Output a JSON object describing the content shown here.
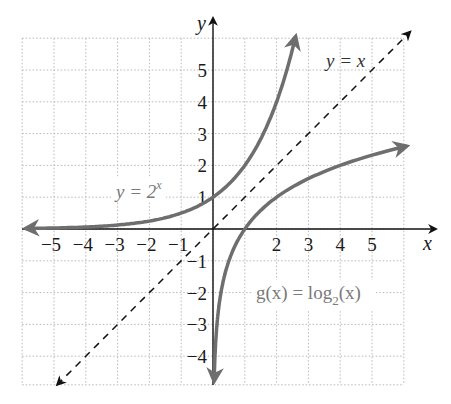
{
  "chart_data": {
    "type": "line",
    "title": "",
    "xlabel": "x",
    "ylabel": "y",
    "xlim": [
      -6,
      6.2
    ],
    "ylim": [
      -4.9,
      6
    ],
    "grid": true,
    "x_ticks": [
      "-5",
      "-4",
      "-3",
      "-2",
      "-1",
      "2",
      "3",
      "4",
      "5"
    ],
    "y_ticks": [
      "5",
      "4",
      "3",
      "2",
      "1",
      "-1",
      "-2",
      "-3",
      "-4"
    ],
    "series": [
      {
        "name": "y = 2^x",
        "label_main": "y = 2",
        "label_sup": "x",
        "style": "solid",
        "color": "#6e6e6e",
        "x": [
          -6,
          -5,
          -4,
          -3,
          -2,
          -1,
          0,
          1,
          2,
          2.6
        ],
        "y": [
          0.016,
          0.031,
          0.063,
          0.125,
          0.25,
          0.5,
          1,
          2,
          4,
          6.06
        ]
      },
      {
        "name": "y = x",
        "label": "y = x",
        "style": "dashed",
        "color": "#111111",
        "x": [
          -4.9,
          6.2
        ],
        "y": [
          -4.9,
          6.2
        ]
      },
      {
        "name": "g(x) = log2(x)",
        "label_main": "g(x) = log",
        "label_sub": "2",
        "label_tail": "(x)",
        "style": "solid",
        "color": "#6e6e6e",
        "x": [
          0.035,
          0.0625,
          0.125,
          0.25,
          0.5,
          1,
          2,
          3,
          4,
          5,
          6.1
        ],
        "y": [
          -4.84,
          -4,
          -3,
          -2,
          -1,
          0,
          1,
          1.585,
          2,
          2.32,
          2.61
        ]
      }
    ]
  },
  "labels": {
    "x_axis": "x",
    "y_axis": "y",
    "exp_main": "y = 2",
    "exp_sup": "x",
    "identity": "y = x",
    "log_main": "g(x) = log",
    "log_sub": "2",
    "log_tail": "(x)"
  }
}
